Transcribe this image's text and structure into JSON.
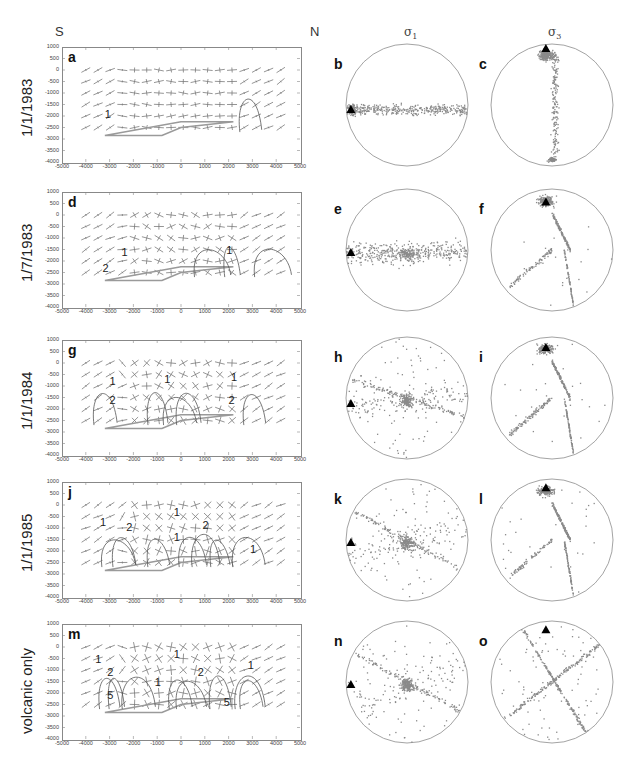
{
  "header": {
    "left_direction": "S",
    "right_direction": "N",
    "col_sigma1": "σ",
    "col_sigma1_sub": "1",
    "col_sigma3": "σ",
    "col_sigma3_sub": "3"
  },
  "rows": [
    {
      "label": "1/1/1983",
      "map_panel": "a",
      "sigma1_panel": "b",
      "sigma3_panel": "c",
      "contours": [
        {
          "text": "1",
          "x": -3200,
          "y": -1900
        }
      ],
      "sigma1_triangle": {
        "dx": -0.92,
        "dy": 0.08
      },
      "sigma3_triangle": {
        "dx": -0.1,
        "dy": -0.92
      }
    },
    {
      "label": "1/7/1983",
      "map_panel": "d",
      "sigma1_panel": "e",
      "sigma3_panel": "f",
      "contours": [
        {
          "text": "1",
          "x": -2500,
          "y": -1600
        },
        {
          "text": "2",
          "x": -3300,
          "y": -2300
        },
        {
          "text": "1",
          "x": 1900,
          "y": -1500
        }
      ],
      "sigma1_triangle": {
        "dx": -0.92,
        "dy": 0.05
      },
      "sigma3_triangle": {
        "dx": -0.1,
        "dy": -0.78
      }
    },
    {
      "label": "1/1/1984",
      "map_panel": "g",
      "sigma1_panel": "h",
      "sigma3_panel": "i",
      "contours": [
        {
          "text": "1",
          "x": -3000,
          "y": -800
        },
        {
          "text": "1",
          "x": -700,
          "y": -700
        },
        {
          "text": "1",
          "x": 2100,
          "y": -600
        },
        {
          "text": "2",
          "x": -3000,
          "y": -1600
        },
        {
          "text": "2",
          "x": 2000,
          "y": -1600
        }
      ],
      "sigma1_triangle": {
        "dx": -0.92,
        "dy": 0.1
      },
      "sigma3_triangle": {
        "dx": -0.1,
        "dy": -0.82
      }
    },
    {
      "label": "1/1/1985",
      "map_panel": "j",
      "sigma1_panel": "k",
      "sigma3_panel": "l",
      "contours": [
        {
          "text": "1",
          "x": -3400,
          "y": -750
        },
        {
          "text": "2",
          "x": -2300,
          "y": -950
        },
        {
          "text": "1",
          "x": -300,
          "y": -300
        },
        {
          "text": "1",
          "x": -300,
          "y": -1400
        },
        {
          "text": "2",
          "x": 900,
          "y": -850
        },
        {
          "text": "1",
          "x": 2900,
          "y": -1900
        }
      ],
      "sigma1_triangle": {
        "dx": -0.92,
        "dy": 0.05
      },
      "sigma3_triangle": {
        "dx": -0.1,
        "dy": -0.85
      }
    },
    {
      "label": "volcanic only",
      "map_panel": "m",
      "sigma1_panel": "n",
      "sigma3_panel": "o",
      "contours": [
        {
          "text": "1",
          "x": -3600,
          "y": -500
        },
        {
          "text": "2",
          "x": -3100,
          "y": -1100
        },
        {
          "text": "5",
          "x": -3100,
          "y": -2100
        },
        {
          "text": "1",
          "x": -300,
          "y": -300
        },
        {
          "text": "1",
          "x": -1100,
          "y": -1500
        },
        {
          "text": "2",
          "x": 700,
          "y": -1100
        },
        {
          "text": "1",
          "x": 2800,
          "y": -800
        },
        {
          "text": "5",
          "x": 1800,
          "y": -2400
        }
      ],
      "sigma1_triangle": {
        "dx": -0.92,
        "dy": 0.05
      },
      "sigma3_triangle": {
        "dx": -0.1,
        "dy": -0.85
      }
    }
  ],
  "map_axes": {
    "x_ticks": [
      "-5000",
      "-4000",
      "-3000",
      "-2000",
      "-1000",
      "0",
      "1000",
      "2000",
      "3000",
      "4000",
      "5000"
    ],
    "y_ticks": [
      "1000",
      "500",
      "0",
      "-500",
      "-1000",
      "-1500",
      "-2000",
      "-2500",
      "-3000",
      "-3500",
      "-4000"
    ],
    "xlim": [
      -5000,
      5000
    ],
    "ylim": [
      -4000,
      1000
    ]
  },
  "colors": {
    "axis": "#888888",
    "ticks_text": "#444444",
    "stress_crosses": "#7a7a7a",
    "contours": "#555555",
    "fault": "#9a9a9a",
    "scatter": "#8a8a8a",
    "triangle": "#000000",
    "circle": "#999999"
  },
  "chart_data": [
    {
      "type": "scatter",
      "title": "Stress field cross-sections (S–N) and stereonets of σ1 and σ3 axes",
      "columns": [
        "S–N cross-section (stress crosses, contours)",
        "σ1 stereonet",
        "σ3 stereonet"
      ],
      "row_labels": [
        "1/1/1983",
        "1/7/1983",
        "1/1/1984",
        "1/1/1985",
        "volcanic only"
      ],
      "panel_labels": [
        "a",
        "b",
        "c",
        "d",
        "e",
        "f",
        "g",
        "h",
        "i",
        "j",
        "k",
        "l",
        "m",
        "n",
        "o"
      ],
      "xlabel": "",
      "ylabel": "",
      "xlim": [
        -5000,
        5000
      ],
      "ylim": [
        -4000,
        1000
      ],
      "x_ticks": [
        -5000,
        -4000,
        -3000,
        -2000,
        -1000,
        0,
        1000,
        2000,
        3000,
        4000,
        5000
      ],
      "y_ticks": [
        1000,
        500,
        0,
        -500,
        -1000,
        -1500,
        -2000,
        -2500,
        -3000,
        -3500,
        -4000
      ],
      "contour_levels_visible": [
        1,
        2,
        5
      ],
      "sigma1_trend": "σ1 scatter evolves from E–W horizontal band (1983) to central cluster + X-pattern (volcanic only); reference triangle at west edge",
      "sigma3_trend": "σ3 scatter evolves from N cluster + N–S band (1983) to X-shaped girdles (volcanic only); reference triangle near north"
    }
  ]
}
